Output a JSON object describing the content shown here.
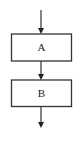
{
  "diagram": {
    "type": "flowchart",
    "nodes": [
      {
        "id": "A",
        "label": "A"
      },
      {
        "id": "B",
        "label": "B"
      }
    ],
    "edges": [
      {
        "from": "start",
        "to": "A"
      },
      {
        "from": "A",
        "to": "B"
      },
      {
        "from": "B",
        "to": "end"
      }
    ],
    "colors": {
      "stroke": "#333333",
      "background": "#ffffff"
    }
  }
}
